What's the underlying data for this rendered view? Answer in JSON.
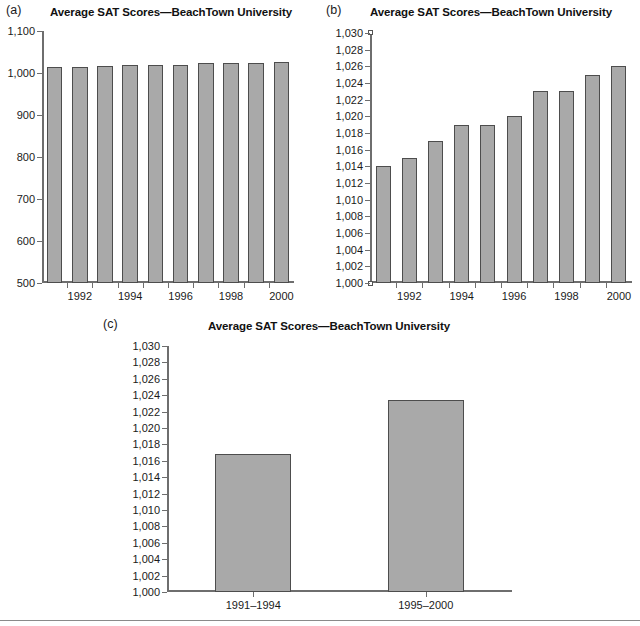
{
  "figure": {
    "shared_title": "Average SAT Scores—BeachTown University",
    "bar_color": "#a9a9a9",
    "bar_border_color": "#4d4d4d",
    "axis_color": "#6e6e6e",
    "background": "#ffffff"
  },
  "panels": [
    {
      "letter": "(a)",
      "title": "Average SAT Scores—BeachTown University"
    },
    {
      "letter": "(b)",
      "title": "Average SAT Scores—BeachTown University"
    },
    {
      "letter": "(c)",
      "title": "Average SAT Scores—BeachTown University"
    }
  ],
  "chart_data": [
    {
      "id": "panel-a",
      "type": "bar",
      "title": "Average SAT Scores—BeachTown University",
      "xlabel": "",
      "ylabel": "",
      "ylim": [
        500,
        1100
      ],
      "ytick_step": 100,
      "ytick_labels": [
        "500",
        "600",
        "700",
        "800",
        "900",
        "1,000",
        "1,100"
      ],
      "ytick_values": [
        500,
        600,
        700,
        800,
        900,
        1000,
        1100
      ],
      "grid": false,
      "legend": "none",
      "categories": [
        "1991",
        "1992",
        "1993",
        "1994",
        "1995",
        "1996",
        "1997",
        "1998",
        "1999",
        "2000"
      ],
      "xtick_labels_shown": [
        "",
        "1992",
        "",
        "1994",
        "",
        "1996",
        "",
        "1998",
        "",
        "2000"
      ],
      "values": [
        1014,
        1015,
        1017,
        1019,
        1019,
        1020,
        1023,
        1023,
        1025,
        1026
      ]
    },
    {
      "id": "panel-b",
      "type": "bar",
      "title": "Average SAT Scores—BeachTown University",
      "xlabel": "",
      "ylabel": "",
      "ylim": [
        1000,
        1030
      ],
      "ytick_step": 2,
      "ytick_labels": [
        "1,000",
        "1,002",
        "1,004",
        "1,006",
        "1,008",
        "1,010",
        "1,012",
        "1,014",
        "1,016",
        "1,018",
        "1,020",
        "1,022",
        "1,024",
        "1,026",
        "1,028",
        "1,030"
      ],
      "ytick_values": [
        1000,
        1002,
        1004,
        1006,
        1008,
        1010,
        1012,
        1014,
        1016,
        1018,
        1020,
        1022,
        1024,
        1026,
        1028,
        1030
      ],
      "grid": false,
      "legend": "none",
      "categories": [
        "1991",
        "1992",
        "1993",
        "1994",
        "1995",
        "1996",
        "1997",
        "1998",
        "1999",
        "2000"
      ],
      "xtick_labels_shown": [
        "",
        "1992",
        "",
        "1994",
        "",
        "1996",
        "",
        "1998",
        "",
        "2000"
      ],
      "values": [
        1014,
        1015,
        1017,
        1019,
        1019,
        1020,
        1023,
        1023,
        1025,
        1026
      ]
    },
    {
      "id": "panel-c",
      "type": "bar",
      "title": "Average SAT Scores—BeachTown University",
      "xlabel": "",
      "ylabel": "",
      "ylim": [
        1000,
        1030
      ],
      "ytick_step": 2,
      "ytick_labels": [
        "1,000",
        "1,002",
        "1,004",
        "1,006",
        "1,008",
        "1,010",
        "1,012",
        "1,014",
        "1,016",
        "1,018",
        "1,020",
        "1,022",
        "1,024",
        "1,026",
        "1,028",
        "1,030"
      ],
      "ytick_values": [
        1000,
        1002,
        1004,
        1006,
        1008,
        1010,
        1012,
        1014,
        1016,
        1018,
        1020,
        1022,
        1024,
        1026,
        1028,
        1030
      ],
      "grid": false,
      "legend": "none",
      "categories": [
        "1991–1994",
        "1995–2000"
      ],
      "xtick_labels_shown": [
        "1991–1994",
        "1995–2000"
      ],
      "values": [
        1016.8,
        1023.4
      ]
    }
  ]
}
